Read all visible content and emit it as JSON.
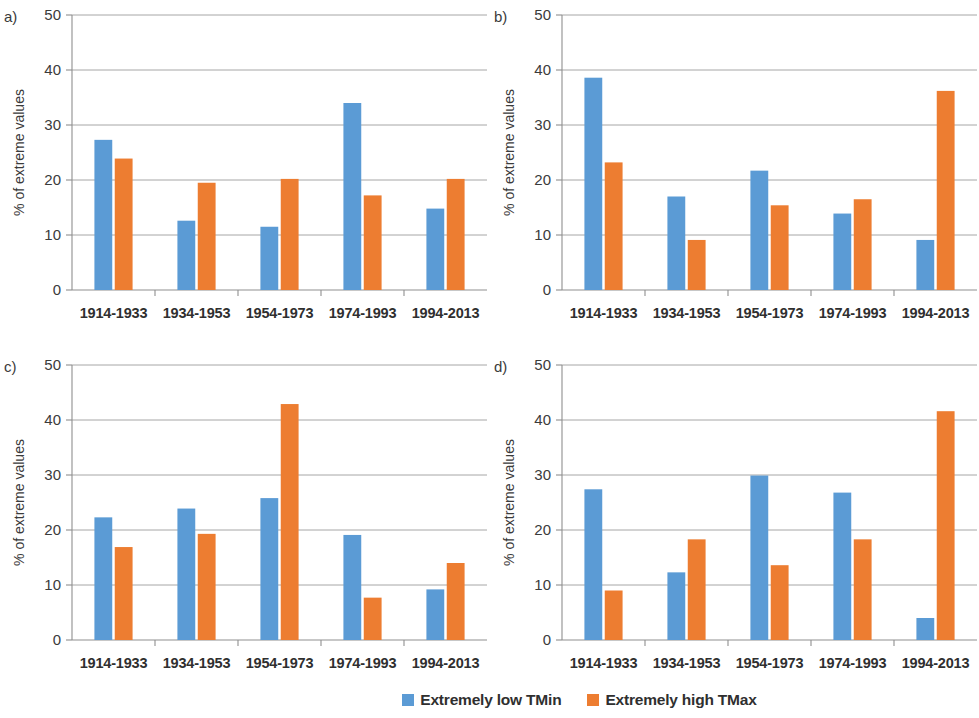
{
  "figure": {
    "title": "",
    "panel_count": 4
  },
  "legend": {
    "position": "bottom-right",
    "entries": [
      {
        "label": "Extremely low TMin",
        "color": "#5b9bd5",
        "icon": "legend-swatch-blue"
      },
      {
        "label": "Extremely high TMax",
        "color": "#ed7d31",
        "icon": "legend-swatch-orange"
      }
    ]
  },
  "axis": {
    "ylabel": "% of extreme values",
    "xlabel": "",
    "ylim": [
      0,
      50
    ],
    "yticks": [
      "0",
      "10",
      "20",
      "30",
      "40",
      "50"
    ],
    "grid": true
  },
  "chart_data": [
    {
      "type": "bar",
      "panel": "a)",
      "title": "",
      "xlabel": "",
      "ylabel": "% of extreme values",
      "ylim": [
        0,
        50
      ],
      "yticks": [
        0,
        10,
        20,
        30,
        40,
        50
      ],
      "grid": true,
      "legend_position": "none",
      "categories": [
        "1914-1933",
        "1934-1953",
        "1954-1973",
        "1974-1993",
        "1994-2013"
      ],
      "series": [
        {
          "name": "Extremely low TMin",
          "color": "#5b9bd5",
          "values": [
            27.3,
            12.6,
            11.5,
            34.0,
            14.8
          ]
        },
        {
          "name": "Extremely high TMax",
          "color": "#ed7d31",
          "values": [
            23.9,
            19.5,
            20.2,
            17.2,
            20.2
          ]
        }
      ]
    },
    {
      "type": "bar",
      "panel": "b)",
      "title": "",
      "xlabel": "",
      "ylabel": "% of extreme values",
      "ylim": [
        0,
        50
      ],
      "yticks": [
        0,
        10,
        20,
        30,
        40,
        50
      ],
      "grid": true,
      "legend_position": "none",
      "categories": [
        "1914-1933",
        "1934-1953",
        "1954-1973",
        "1974-1993",
        "1994-2013"
      ],
      "series": [
        {
          "name": "Extremely low TMin",
          "color": "#5b9bd5",
          "values": [
            38.6,
            17.0,
            21.7,
            13.9,
            9.1
          ]
        },
        {
          "name": "Extremely high TMax",
          "color": "#ed7d31",
          "values": [
            23.2,
            9.1,
            15.4,
            16.5,
            36.2
          ]
        }
      ]
    },
    {
      "type": "bar",
      "panel": "c)",
      "title": "",
      "xlabel": "",
      "ylabel": "% of extreme values",
      "ylim": [
        0,
        50
      ],
      "yticks": [
        0,
        10,
        20,
        30,
        40,
        50
      ],
      "grid": true,
      "legend_position": "none",
      "categories": [
        "1914-1933",
        "1934-1953",
        "1954-1973",
        "1974-1993",
        "1994-2013"
      ],
      "series": [
        {
          "name": "Extremely low TMin",
          "color": "#5b9bd5",
          "values": [
            22.3,
            23.9,
            25.8,
            19.1,
            9.2
          ]
        },
        {
          "name": "Extremely high TMax",
          "color": "#ed7d31",
          "values": [
            16.9,
            19.3,
            42.9,
            7.7,
            14.0
          ]
        }
      ]
    },
    {
      "type": "bar",
      "panel": "d)",
      "title": "",
      "xlabel": "",
      "ylabel": "% of extreme values",
      "ylim": [
        0,
        50
      ],
      "yticks": [
        0,
        10,
        20,
        30,
        40,
        50
      ],
      "grid": true,
      "legend_position": "bottom",
      "categories": [
        "1914-1933",
        "1934-1953",
        "1954-1973",
        "1974-1993",
        "1994-2013"
      ],
      "series": [
        {
          "name": "Extremely low TMin",
          "color": "#5b9bd5",
          "values": [
            27.4,
            12.3,
            29.9,
            26.8,
            4.0
          ]
        },
        {
          "name": "Extremely high TMax",
          "color": "#ed7d31",
          "values": [
            9.0,
            18.3,
            13.6,
            18.3,
            41.6
          ]
        }
      ]
    }
  ]
}
